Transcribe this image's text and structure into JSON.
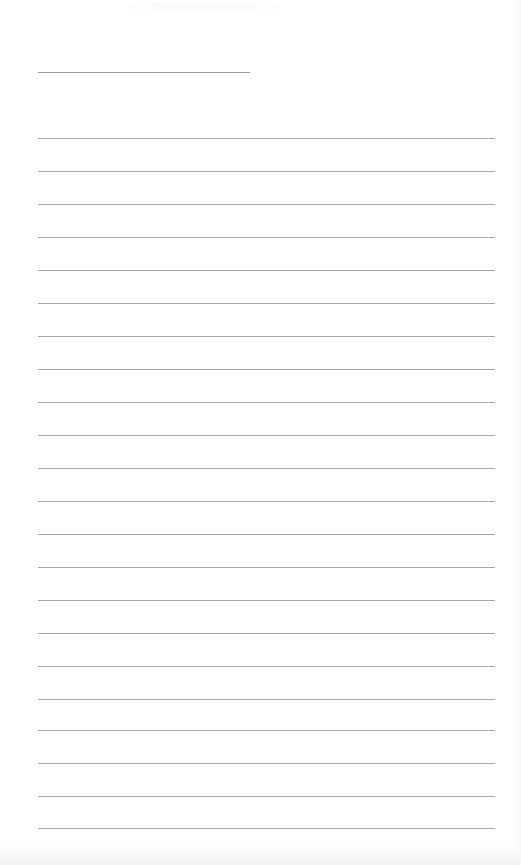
{
  "page": {
    "type": "lined-notepad",
    "background_color": "#ffffff",
    "line_color": "#a8a8a8",
    "header_line": {
      "left": 38,
      "top": 72,
      "width": 212,
      "color": "#9a9a9a"
    },
    "ruled_lines": {
      "left": 38,
      "width": 457,
      "positions": [
        138,
        171,
        204,
        237,
        270,
        303,
        336,
        369,
        402,
        435,
        468,
        501,
        534,
        567,
        600,
        633,
        666,
        699,
        730,
        763,
        796,
        828
      ]
    }
  }
}
